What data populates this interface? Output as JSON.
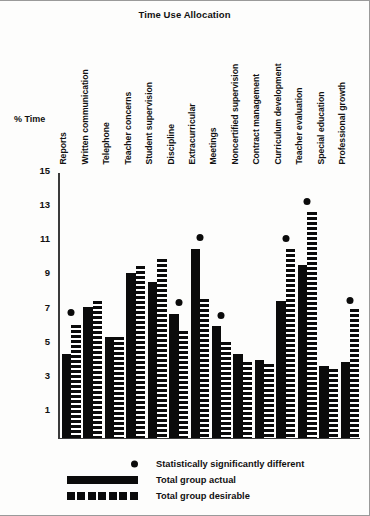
{
  "chart_data": {
    "type": "bar",
    "title": "Time Use Allocation",
    "xlabel": "",
    "ylabel": "% Time",
    "ylim": [
      0,
      15
    ],
    "yticks": [
      15,
      13,
      11,
      9,
      7,
      5,
      3,
      1
    ],
    "grid": false,
    "legend_position": "bottom-left",
    "categories": [
      "Reports",
      "Written communication",
      "Telephone",
      "Teacher concerns",
      "Student supervision",
      "Discipline",
      "Extracurricular",
      "Meetings",
      "Noncertified supervision",
      "Contract management",
      "Curriculum development",
      "Teacher evaluation",
      "Special education",
      "Professional growth"
    ],
    "series": [
      {
        "name": "Total group actual",
        "values": [
          4.9,
          7.6,
          5.9,
          9.6,
          9.1,
          7.2,
          11.0,
          6.5,
          4.9,
          4.5,
          8.0,
          10.1,
          4.2,
          4.4
        ]
      },
      {
        "name": "Total group desirable",
        "values": [
          6.6,
          8.0,
          5.9,
          10.0,
          10.4,
          6.2,
          8.1,
          5.6,
          4.4,
          4.3,
          11.0,
          13.2,
          4.0,
          7.5
        ]
      }
    ],
    "significance_markers": {
      "label": "Statistically significantly different",
      "categories": [
        "Reports",
        "Discipline",
        "Extracurricular",
        "Meetings",
        "Curriculum development",
        "Teacher evaluation",
        "Professional growth"
      ],
      "values": [
        7.1,
        7.7,
        11.5,
        6.9,
        11.4,
        13.6,
        7.8
      ]
    },
    "legend": [
      {
        "key": "dot",
        "label": "Statistically significantly different"
      },
      {
        "key": "solid-bar",
        "label": "Total group actual"
      },
      {
        "key": "dashed-bar",
        "label": "Total group desirable"
      }
    ],
    "colors": {
      "bar": "#0b0b0b",
      "axis": "#3b3b3b",
      "background": "#fdfdfc"
    }
  }
}
